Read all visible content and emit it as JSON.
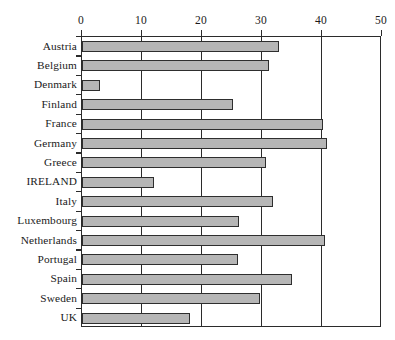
{
  "chart_data": {
    "type": "bar",
    "orientation": "horizontal",
    "title": "",
    "subtitle": "",
    "xlabel": "",
    "ylabel": "",
    "xlim": [
      0,
      50
    ],
    "ylim": null,
    "xticks": [
      0,
      10,
      20,
      30,
      40,
      50
    ],
    "xtick_labels": [
      "0",
      "10",
      "20",
      "30",
      "40",
      "50"
    ],
    "grid": true,
    "grid_axis": "x",
    "legend": false,
    "legend_position": "none",
    "axis_position": "top",
    "bar_fill_color": "#b6b6b6",
    "bar_edge_color": "#2e2e2e",
    "frame_color": "#2b2b2b",
    "background_color": "#ffffff",
    "categories": [
      "Austria",
      "Belgium",
      "Denmark",
      "Finland",
      "France",
      "Germany",
      "Greece",
      "IRELAND",
      "Italy",
      "Luxembourg",
      "Netherlands",
      "Portugal",
      "Spain",
      "Sweden",
      "UK"
    ],
    "values": [
      33.0,
      31.3,
      3.0,
      25.3,
      40.4,
      41.1,
      30.9,
      12.1,
      32.0,
      26.3,
      40.7,
      26.1,
      35.3,
      29.8,
      18.2
    ]
  }
}
